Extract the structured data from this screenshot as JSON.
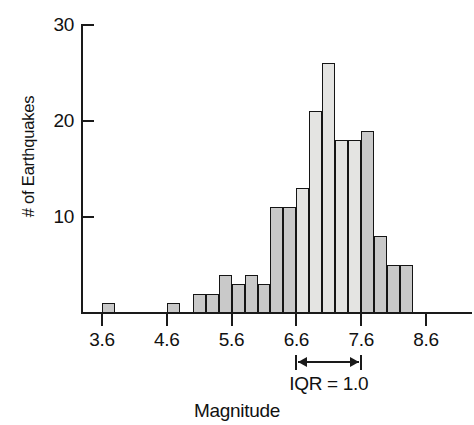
{
  "chart_data": {
    "type": "bar",
    "title": "",
    "subtitle": "",
    "xlabel": "Magnitude",
    "ylabel": "# of Earthquakes",
    "grid": false,
    "legend": "none",
    "bin_width": 0.2,
    "xlim": [
      3.5,
      8.7
    ],
    "ylim": [
      0,
      30
    ],
    "x_tick_labels": [
      "3.6",
      "4.6",
      "5.6",
      "6.6",
      "7.6",
      "8.6"
    ],
    "x_tick_values": [
      3.6,
      4.6,
      5.6,
      6.6,
      7.6,
      8.6
    ],
    "y_tick_labels": [
      "10",
      "20",
      "30"
    ],
    "y_tick_values": [
      10,
      20,
      30
    ],
    "bin_starts": [
      3.6,
      3.8,
      4.0,
      4.2,
      4.4,
      4.6,
      4.8,
      5.0,
      5.2,
      5.4,
      5.6,
      5.8,
      6.0,
      6.2,
      6.4,
      6.6,
      6.8,
      7.0,
      7.2,
      7.4,
      7.6,
      7.8,
      8.0,
      8.2
    ],
    "categories": [
      "3.6",
      "3.8",
      "4.0",
      "4.2",
      "4.4",
      "4.6",
      "4.8",
      "5.0",
      "5.2",
      "5.4",
      "5.6",
      "5.8",
      "6.0",
      "6.2",
      "6.4",
      "6.6",
      "6.8",
      "7.0",
      "7.2",
      "7.4",
      "7.6",
      "7.8",
      "8.0",
      "8.2"
    ],
    "values": [
      1,
      0,
      0,
      0,
      0,
      1,
      0,
      2,
      2,
      4,
      3,
      4,
      3,
      11,
      11,
      13,
      21,
      26,
      18,
      18,
      19,
      8,
      5,
      5
    ],
    "bar_shades": [
      "dark",
      "dark",
      "dark",
      "dark",
      "dark",
      "dark",
      "dark",
      "dark",
      "dark",
      "dark",
      "dark",
      "dark",
      "dark",
      "dark",
      "dark",
      "light",
      "light",
      "light",
      "light",
      "light",
      "dark",
      "dark",
      "dark",
      "dark"
    ],
    "annotations": [
      {
        "name": "iqr-marker",
        "label": "IQR = 1.0",
        "from_x": 6.6,
        "to_x": 7.6,
        "value": 1.0
      }
    ],
    "colors": {
      "bar_fill_dark": "#c9c9c9",
      "bar_fill_light": "#e4e4e2",
      "bar_stroke": "#151515",
      "axis": "#1a1a1a",
      "text": "#111111",
      "background": "#ffffff"
    }
  }
}
